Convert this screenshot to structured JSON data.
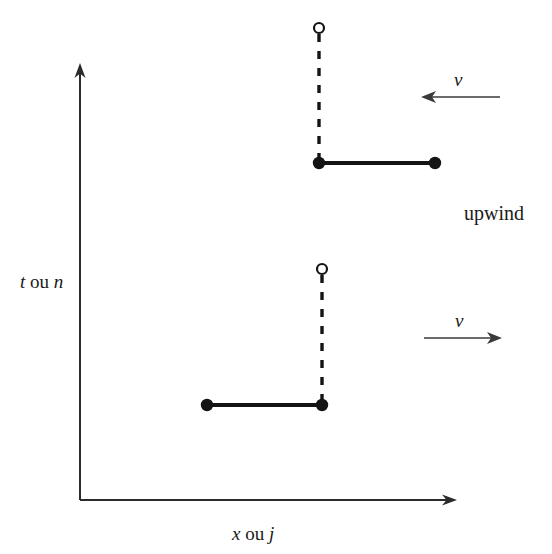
{
  "figure": {
    "type": "stencil-diagram",
    "background_color": "#ffffff",
    "stroke_color": "#1a1a1a",
    "axes": {
      "y": {
        "label_italic_1": "t",
        "label_roman": " ou ",
        "label_italic_2": "n",
        "label_full": "t ou n",
        "origin": [
          80,
          500
        ],
        "tip": [
          80,
          65
        ]
      },
      "x": {
        "label_italic_1": "x",
        "label_roman": " ou ",
        "label_italic_2": "j",
        "label_full": "x ou j",
        "origin": [
          80,
          500
        ],
        "tip": [
          456,
          500
        ]
      }
    },
    "stencils": [
      {
        "name": "upwind-negative-velocity",
        "position": "upper",
        "open_node": {
          "x": 319,
          "y": 28,
          "radius": 5
        },
        "dashed_segment": {
          "x1": 319,
          "y1": 34,
          "x2": 319,
          "y2": 163
        },
        "solid_segment": {
          "x1": 319,
          "y1": 163,
          "x2": 435,
          "y2": 163
        },
        "filled_nodes": [
          {
            "x": 319,
            "y": 163,
            "radius": 6
          },
          {
            "x": 435,
            "y": 163,
            "radius": 6
          }
        ],
        "arrow": {
          "label": "v",
          "direction": "left",
          "x_start": 500,
          "x_end": 424,
          "y": 97
        }
      },
      {
        "name": "upwind-positive-velocity",
        "position": "lower",
        "open_node": {
          "x": 322,
          "y": 269,
          "radius": 5
        },
        "dashed_segment": {
          "x1": 322,
          "y1": 275,
          "x2": 322,
          "y2": 405
        },
        "solid_segment": {
          "x1": 207,
          "y1": 405,
          "x2": 322,
          "y2": 405
        },
        "filled_nodes": [
          {
            "x": 207,
            "y": 405,
            "radius": 6
          },
          {
            "x": 322,
            "y": 405,
            "radius": 6
          }
        ],
        "arrow": {
          "label": "v",
          "direction": "right",
          "x_start": 424,
          "x_end": 500,
          "y": 338
        }
      }
    ],
    "annotations": {
      "scheme_name": "upwind"
    }
  }
}
